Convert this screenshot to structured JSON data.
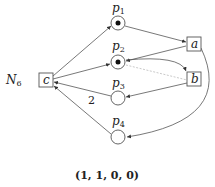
{
  "net_name": "N",
  "net_sub": "6",
  "places": [
    {
      "id": "p1",
      "label": "p",
      "sub": "1",
      "tokens": 1
    },
    {
      "id": "p2",
      "label": "p",
      "sub": "2",
      "tokens": 1
    },
    {
      "id": "p3",
      "label": "p",
      "sub": "3",
      "tokens": 0
    },
    {
      "id": "p4",
      "label": "p",
      "sub": "4",
      "tokens": 0
    }
  ],
  "transitions": [
    {
      "id": "a",
      "label": "a"
    },
    {
      "id": "b",
      "label": "b"
    },
    {
      "id": "c",
      "label": "c"
    }
  ],
  "arc_weight_p3_c": "2",
  "marking": "(1, 1, 0, 0)"
}
